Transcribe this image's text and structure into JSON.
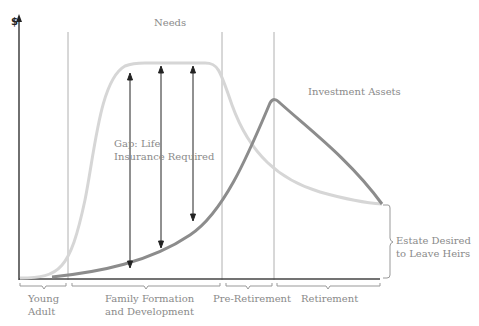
{
  "diagram": {
    "y_axis_label": "$",
    "curves": {
      "needs": {
        "label": "Needs",
        "color": "#d6d6d6"
      },
      "investment_assets": {
        "label": "Investment Assets",
        "color": "#8c8c8c"
      }
    },
    "gap_label_line1": "Gap: Life",
    "gap_label_line2": "Insurance Required",
    "estate_label_line1": "Estate Desired",
    "estate_label_line2": "to Leave Heirs",
    "stages": [
      {
        "line1": "Young",
        "line2": "Adult"
      },
      {
        "line1": "Family Formation",
        "line2": "and Development"
      },
      {
        "line1": "Pre-Retirement",
        "line2": ""
      },
      {
        "line1": "Retirement",
        "line2": ""
      }
    ]
  }
}
